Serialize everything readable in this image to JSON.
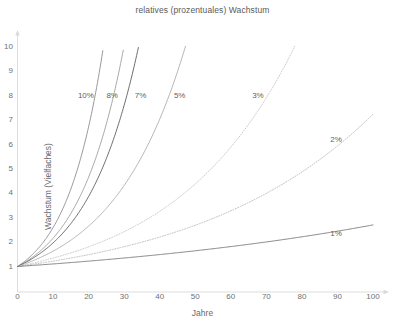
{
  "chart_data": {
    "type": "line",
    "title": "relatives (prozentuales) Wachstum",
    "xlabel": "Jahre",
    "ylabel": "Wachstum (Vielfaches)",
    "xlim": [
      0,
      100
    ],
    "ylim": [
      1,
      10
    ],
    "x_ticks": [
      "0",
      "10",
      "20",
      "30",
      "40",
      "50",
      "60",
      "70",
      "80",
      "90",
      "100"
    ],
    "x_tick_values": [
      0,
      10,
      20,
      30,
      40,
      50,
      60,
      70,
      80,
      90,
      100
    ],
    "y_ticks": [
      "1",
      "2",
      "3",
      "4",
      "5",
      "6",
      "7",
      "8",
      "9",
      "10"
    ],
    "y_tick_values": [
      1,
      2,
      3,
      4,
      5,
      6,
      7,
      8,
      9,
      10
    ],
    "grid": false,
    "legend": "inline-curve-labels",
    "formula": "(1 + r)^t",
    "series": [
      {
        "name": "10%",
        "rate": 0.1,
        "style": "solid",
        "color": "#888888",
        "label": "10%",
        "label_x_years": 17,
        "label_y_value": 8,
        "x": [
          0,
          10,
          20,
          24.2,
          25
        ],
        "values": [
          1,
          2.594,
          6.727,
          9.85,
          10.0
        ]
      },
      {
        "name": "8%",
        "rate": 0.08,
        "style": "solid",
        "color": "#9a9a9a",
        "label": "8%",
        "label_x_years": 25,
        "label_y_value": 8,
        "x": [
          0,
          10,
          20,
          29,
          30
        ],
        "values": [
          1,
          2.159,
          4.661,
          9.317,
          10.06
        ]
      },
      {
        "name": "7%",
        "rate": 0.07,
        "style": "solid",
        "color": "#555555",
        "label": "7%",
        "label_x_years": 33,
        "label_y_value": 8,
        "x": [
          0,
          10,
          20,
          30,
          34
        ],
        "values": [
          1,
          1.967,
          3.87,
          7.612,
          9.978
        ]
      },
      {
        "name": "5%",
        "rate": 0.05,
        "style": "solid",
        "color": "#a8a8a8",
        "label": "5%",
        "label_x_years": 44,
        "label_y_value": 8,
        "x": [
          0,
          10,
          20,
          30,
          40,
          47.2
        ],
        "values": [
          1,
          1.629,
          2.653,
          4.322,
          7.04,
          10.0
        ]
      },
      {
        "name": "3%",
        "rate": 0.03,
        "style": "dotted",
        "color": "#c0c0c0",
        "label": "3%",
        "label_x_years": 66,
        "label_y_value": 8,
        "x": [
          0,
          20,
          40,
          60,
          78
        ],
        "values": [
          1,
          1.806,
          3.262,
          5.892,
          10.05
        ]
      },
      {
        "name": "2%",
        "rate": 0.02,
        "style": "dotted",
        "color": "#b4b4b4",
        "label": "2%",
        "label_x_years": 88,
        "label_y_value": 6.2,
        "x": [
          0,
          25,
          50,
          75,
          100
        ],
        "values": [
          1,
          1.641,
          2.692,
          4.416,
          7.245
        ]
      },
      {
        "name": "1%",
        "rate": 0.01,
        "style": "solid",
        "color": "#6e6e6e",
        "label": "1%",
        "label_x_years": 88,
        "label_y_value": 2.35,
        "x": [
          0,
          25,
          50,
          75,
          100
        ],
        "values": [
          1,
          1.282,
          1.645,
          2.109,
          2.705
        ]
      }
    ]
  },
  "axes": {
    "x_arrow": "arrow-right",
    "y_arrow": "arrow-up",
    "axis_color": "#d9d9d9"
  }
}
